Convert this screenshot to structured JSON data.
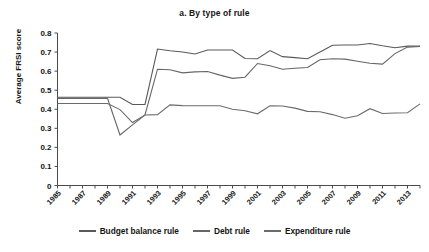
{
  "chart_data": {
    "type": "line",
    "title": "a. By type of rule",
    "xlabel": "",
    "ylabel": "Average FRSI score",
    "ylim": [
      0,
      0.8
    ],
    "ytick_step": 0.1,
    "xlim": [
      1985,
      2014
    ],
    "grid": false,
    "legend_position": "bottom",
    "yticks": [
      "0.8",
      "0.7",
      "0.6",
      "0.5",
      "0.4",
      "0.3",
      "0.2",
      "0.1",
      "0"
    ],
    "x": [
      1985,
      1986,
      1987,
      1988,
      1989,
      1990,
      1991,
      1992,
      1993,
      1994,
      1995,
      1996,
      1997,
      1998,
      1999,
      2000,
      2001,
      2002,
      2003,
      2004,
      2005,
      2006,
      2007,
      2008,
      2009,
      2010,
      2011,
      2012,
      2013,
      2014
    ],
    "xticks": [
      "1985",
      "1987",
      "1989",
      "1991",
      "1993",
      "1995",
      "1997",
      "1999",
      "2001",
      "2003",
      "2005",
      "2007",
      "2009",
      "2011",
      "2013"
    ],
    "series": [
      {
        "name": "Budget balance rule",
        "color": "#595959",
        "values": [
          0.463,
          0.463,
          0.463,
          0.463,
          0.463,
          0.463,
          0.425,
          0.425,
          0.716,
          0.707,
          0.7,
          0.69,
          0.711,
          0.711,
          0.711,
          0.666,
          0.665,
          0.708,
          0.676,
          0.671,
          0.665,
          0.7,
          0.736,
          0.737,
          0.737,
          0.745,
          0.733,
          0.723,
          0.731,
          0.732
        ]
      },
      {
        "name": "Debt rule",
        "color": "#666666",
        "values": [
          0.457,
          0.457,
          0.457,
          0.457,
          0.457,
          0.265,
          0.318,
          0.37,
          0.61,
          0.607,
          0.591,
          0.596,
          0.598,
          0.579,
          0.562,
          0.568,
          0.64,
          0.628,
          0.61,
          0.615,
          0.619,
          0.66,
          0.665,
          0.663,
          0.652,
          0.641,
          0.637,
          0.692,
          0.726,
          0.729
        ]
      },
      {
        "name": "Expenditure rule",
        "color": "#6b6b6b",
        "values": [
          0.43,
          0.43,
          0.43,
          0.43,
          0.43,
          0.398,
          0.33,
          0.37,
          0.372,
          0.423,
          0.419,
          0.418,
          0.418,
          0.418,
          0.4,
          0.392,
          0.376,
          0.418,
          0.417,
          0.406,
          0.389,
          0.387,
          0.372,
          0.353,
          0.366,
          0.403,
          0.378,
          0.38,
          0.382,
          0.428
        ]
      }
    ]
  },
  "legend": {
    "items": [
      {
        "label": "Budget balance rule",
        "color": "#595959"
      },
      {
        "label": "Debt rule",
        "color": "#666666"
      },
      {
        "label": "Expenditure rule",
        "color": "#6b6b6b"
      }
    ]
  }
}
